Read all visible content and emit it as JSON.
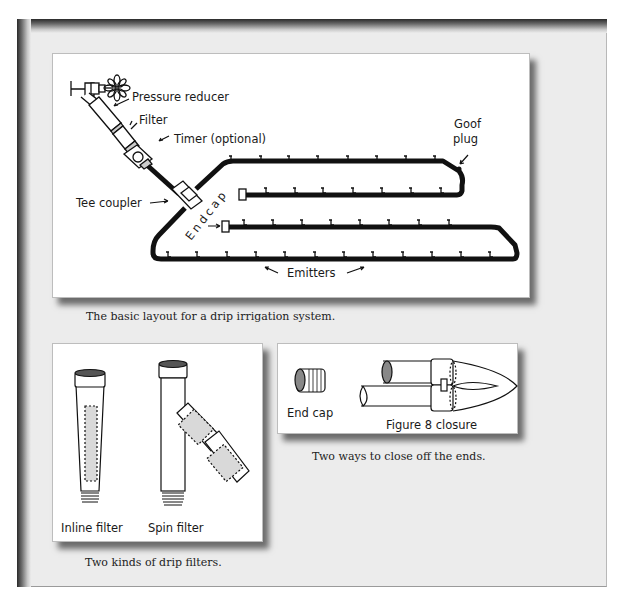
{
  "main_figure": {
    "labels": {
      "pressure_reducer": "Pressure reducer",
      "filter": "Filter",
      "timer": "Timer (optional)",
      "tee_coupler": "Tee coupler",
      "endcap": "Endcap",
      "goof_plug_line1": "Goof",
      "goof_plug_line2": "plug",
      "emitters": "Emitters"
    },
    "caption": "The basic layout for a drip irrigation system."
  },
  "filters_figure": {
    "labels": {
      "inline_filter": "Inline filter",
      "spin_filter": "Spin filter"
    },
    "caption": "Two kinds of drip filters."
  },
  "closure_figure": {
    "labels": {
      "end_cap": "End cap",
      "figure8": "Figure 8 closure"
    },
    "caption": "Two ways to close off the ends."
  },
  "colors": {
    "frame_bg": "#ececec",
    "panel_bg": "#ffffff",
    "line": "#111111",
    "caption_text": "#222222"
  }
}
